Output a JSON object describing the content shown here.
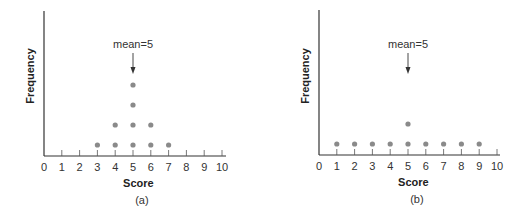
{
  "chart_data": [
    {
      "type": "scatter",
      "subtype": "dot-plot",
      "caption": "(a)",
      "xlabel": "Score",
      "ylabel": "Frequency",
      "xlim": [
        0,
        10
      ],
      "xticks": [
        "0",
        "1",
        "2",
        "3",
        "4",
        "5",
        "6",
        "7",
        "8",
        "9",
        "10"
      ],
      "annotation": {
        "text": "mean=5",
        "x": 5
      },
      "categories": [
        3,
        4,
        5,
        6,
        7
      ],
      "values": [
        1,
        2,
        4,
        2,
        1
      ],
      "grid": false,
      "dot_color": "#8a8a8a"
    },
    {
      "type": "scatter",
      "subtype": "dot-plot",
      "caption": "(b)",
      "xlabel": "Score",
      "ylabel": "Frequency",
      "xlim": [
        0,
        10
      ],
      "xticks": [
        "0",
        "1",
        "2",
        "3",
        "4",
        "5",
        "6",
        "7",
        "8",
        "9",
        "10"
      ],
      "annotation": {
        "text": "mean=5",
        "x": 5
      },
      "categories": [
        1,
        2,
        3,
        4,
        5,
        6,
        7,
        8,
        9
      ],
      "values": [
        1,
        1,
        1,
        1,
        2,
        1,
        1,
        1,
        1
      ],
      "grid": false,
      "dot_color": "#8a8a8a"
    }
  ]
}
